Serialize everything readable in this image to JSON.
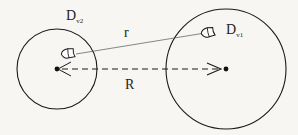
{
  "diagram": {
    "type": "physics-two-volumes",
    "labels": {
      "volume_left": {
        "base": "D",
        "sub": "v2"
      },
      "volume_right": {
        "base": "D",
        "sub": "v1"
      },
      "distance_elements": "r",
      "distance_centers": "R"
    },
    "shapes": {
      "left_circle": {
        "cx": 57,
        "cy": 69,
        "r": 40
      },
      "right_circle": {
        "cx": 226,
        "cy": 69,
        "r": 60
      }
    },
    "colors": {
      "stroke": "#1a1a1a",
      "thin_line": "#555555",
      "background": "#f7f6f3"
    }
  }
}
